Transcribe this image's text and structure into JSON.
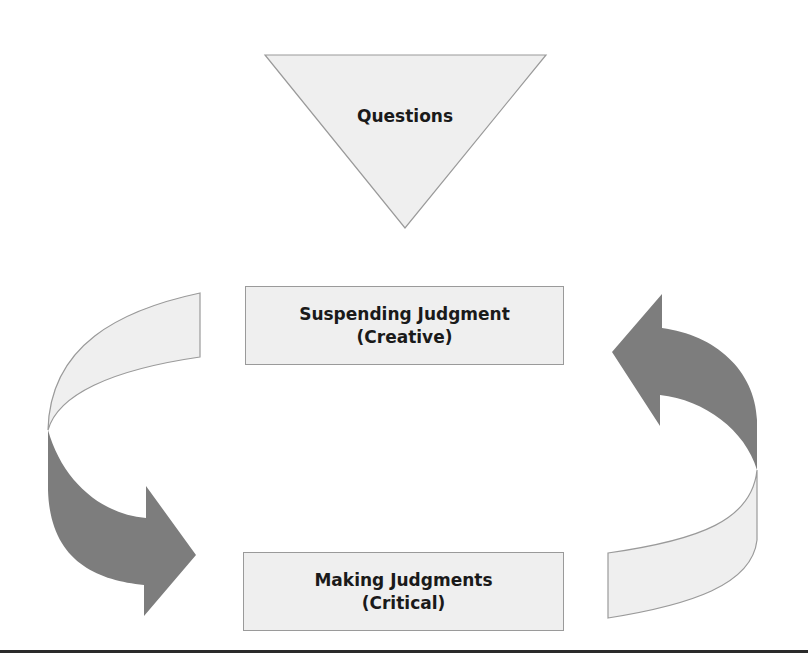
{
  "diagram": {
    "triangle": {
      "label": "Questions"
    },
    "top_box": {
      "line1": "Suspending Judgment",
      "line2": "(Creative)"
    },
    "bottom_box": {
      "line1": "Making Judgments",
      "line2": "(Critical)"
    },
    "arrows": [
      {
        "name": "left-curved-arrow",
        "direction": "down-right",
        "from": "Suspending Judgment",
        "to": "Making Judgments"
      },
      {
        "name": "right-curved-arrow",
        "direction": "up-left",
        "from": "Making Judgments",
        "to": "Suspending Judgment"
      }
    ],
    "colors": {
      "light_fill": "#efefef",
      "dark_fill": "#7d7d7d",
      "stroke": "#9a9a9a",
      "rule": "#2a2a2a"
    }
  }
}
